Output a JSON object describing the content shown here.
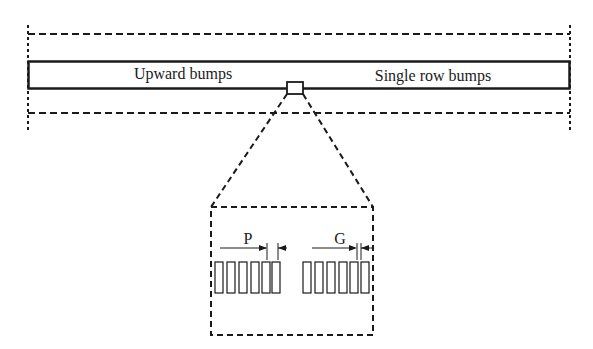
{
  "diagram": {
    "strip_labels": {
      "left": "Upward bumps",
      "right": "Single row bumps"
    },
    "detail_labels": {
      "pitch": "P",
      "gap": "G"
    },
    "colors": {
      "line": "#1a1a1a",
      "background": "#ffffff"
    },
    "bump_groups": [
      {
        "name": "left-group",
        "count": 6
      },
      {
        "name": "right-group",
        "count": 6
      }
    ]
  }
}
